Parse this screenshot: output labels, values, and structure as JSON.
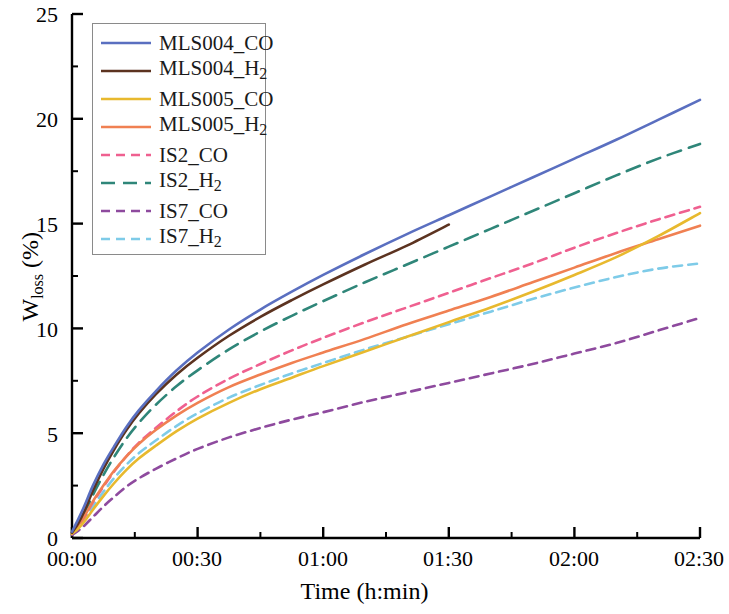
{
  "chart_data": {
    "type": "line",
    "title": "",
    "xlabel": "Time (h:min)",
    "ylabel": "W_loss (%)",
    "ylabel_base": "W",
    "ylabel_sub": "loss",
    "ylabel_unit": " (%)",
    "xlim": [
      0,
      150
    ],
    "ylim": [
      0,
      25
    ],
    "grid": false,
    "legend_position": "upper left",
    "x_tick_labels": [
      "00:00",
      "00:30",
      "01:00",
      "01:30",
      "02:00",
      "02:30"
    ],
    "x_tick_values": [
      0,
      30,
      60,
      90,
      120,
      150
    ],
    "y_tick_labels": [
      "0",
      "5",
      "10",
      "15",
      "20",
      "25"
    ],
    "y_tick_values": [
      0,
      5,
      10,
      15,
      20,
      25
    ],
    "x_minor_interval": 15,
    "y_minor_interval": 2.5,
    "series": [
      {
        "name": "MLS004_CO",
        "label_base": "MLS004_CO",
        "color": "#5a6fc0",
        "style": "solid",
        "x": [
          0,
          1.5,
          3,
          5,
          7.5,
          10,
          13,
          16,
          20,
          25,
          30,
          37.5,
          45,
          52.5,
          60,
          70,
          80,
          90,
          100,
          110,
          120,
          130,
          140,
          150
        ],
        "y": [
          0.3,
          0.9,
          1.55,
          2.5,
          3.5,
          4.35,
          5.3,
          6.1,
          7.0,
          8.0,
          8.85,
          9.95,
          10.9,
          11.75,
          12.55,
          13.55,
          14.5,
          15.4,
          16.3,
          17.2,
          18.1,
          19.0,
          19.95,
          20.9
        ]
      },
      {
        "name": "MLS004_H2",
        "label_base": "MLS004_",
        "label_sub": "2",
        "label_mid": "H",
        "color": "#5c3320",
        "style": "solid",
        "x": [
          0,
          1.5,
          3,
          5,
          7.5,
          10,
          13,
          16,
          20,
          25,
          30,
          37.5,
          45,
          52.5,
          60,
          70,
          80,
          90
        ],
        "y": [
          0.25,
          0.7,
          1.3,
          2.25,
          3.3,
          4.2,
          5.15,
          5.95,
          6.85,
          7.8,
          8.6,
          9.65,
          10.55,
          11.35,
          12.1,
          13.05,
          13.95,
          14.95
        ]
      },
      {
        "name": "MLS005_CO",
        "label_base": "MLS005_CO",
        "color": "#e8b92e",
        "style": "solid",
        "x": [
          0,
          1.5,
          3,
          5,
          7.5,
          10,
          13,
          16,
          20,
          25,
          30,
          37.5,
          45,
          52.5,
          60,
          70,
          80,
          90,
          100,
          110,
          120,
          130,
          140,
          150
        ],
        "y": [
          0.2,
          0.45,
          0.8,
          1.35,
          2.0,
          2.6,
          3.25,
          3.8,
          4.4,
          5.1,
          5.7,
          6.45,
          7.1,
          7.65,
          8.2,
          8.9,
          9.6,
          10.3,
          11.0,
          11.75,
          12.55,
          13.4,
          14.4,
          15.5
        ]
      },
      {
        "name": "MLS005_H2",
        "label_base": "MLS005_",
        "label_sub": "2",
        "label_mid": "H",
        "color": "#f08052",
        "style": "solid",
        "x": [
          0,
          1.5,
          3,
          5,
          7.5,
          10,
          13,
          16,
          20,
          25,
          30,
          37.5,
          45,
          52.5,
          60,
          70,
          80,
          90,
          100,
          110,
          120,
          130,
          140,
          150
        ],
        "y": [
          0.25,
          0.6,
          1.05,
          1.75,
          2.5,
          3.2,
          3.9,
          4.5,
          5.15,
          5.85,
          6.45,
          7.2,
          7.8,
          8.35,
          8.85,
          9.5,
          10.2,
          10.85,
          11.5,
          12.2,
          12.9,
          13.6,
          14.25,
          14.9
        ]
      },
      {
        "name": "IS2_CO",
        "label_base": "IS2_CO",
        "color": "#ef6090",
        "style": "dashed",
        "dash": "9,6",
        "x": [
          0,
          1.5,
          3,
          5,
          7.5,
          10,
          13,
          16,
          20,
          25,
          30,
          37.5,
          45,
          52.5,
          60,
          70,
          80,
          90,
          100,
          110,
          120,
          130,
          140,
          150
        ],
        "y": [
          0.2,
          0.55,
          1.0,
          1.7,
          2.45,
          3.15,
          3.9,
          4.55,
          5.25,
          6.05,
          6.75,
          7.6,
          8.3,
          8.95,
          9.55,
          10.3,
          11.0,
          11.7,
          12.4,
          13.1,
          13.85,
          14.55,
          15.2,
          15.8
        ]
      },
      {
        "name": "IS2_H2",
        "label_base": "IS2_",
        "label_sub": "2",
        "label_mid": "H",
        "color": "#2f8679",
        "style": "dashed",
        "dash": "14,8",
        "x": [
          0,
          1.5,
          3,
          5,
          7.5,
          10,
          13,
          16,
          20,
          25,
          30,
          37.5,
          45,
          52.5,
          60,
          70,
          80,
          90,
          100,
          110,
          120,
          130,
          140,
          150
        ],
        "y": [
          0.25,
          0.65,
          1.2,
          2.05,
          3.0,
          3.85,
          4.75,
          5.5,
          6.35,
          7.25,
          8.0,
          9.0,
          9.85,
          10.6,
          11.3,
          12.2,
          13.05,
          13.9,
          14.75,
          15.6,
          16.45,
          17.3,
          18.1,
          18.8
        ]
      },
      {
        "name": "IS7_CO",
        "label_base": "IS7_CO",
        "color": "#8e4a9e",
        "style": "dashed",
        "dash": "9,6",
        "x": [
          0,
          1.5,
          3,
          5,
          7.5,
          10,
          13,
          16,
          20,
          25,
          30,
          37.5,
          45,
          52.5,
          60,
          70,
          80,
          90,
          100,
          110,
          120,
          130,
          140,
          150
        ],
        "y": [
          0.15,
          0.35,
          0.6,
          1.0,
          1.5,
          1.95,
          2.45,
          2.85,
          3.3,
          3.8,
          4.25,
          4.8,
          5.25,
          5.65,
          6.0,
          6.5,
          6.95,
          7.4,
          7.85,
          8.3,
          8.8,
          9.3,
          9.9,
          10.5
        ]
      },
      {
        "name": "IS7_H2",
        "label_base": "IS7_",
        "label_sub": "2",
        "label_mid": "H",
        "color": "#7ecbe8",
        "style": "dashed",
        "dash": "9,6",
        "x": [
          0,
          1.5,
          3,
          5,
          7.5,
          10,
          13,
          16,
          20,
          25,
          30,
          37.5,
          45,
          52.5,
          60,
          70,
          80,
          90,
          100,
          110,
          120,
          130,
          140,
          150
        ],
        "y": [
          0.2,
          0.5,
          0.9,
          1.5,
          2.2,
          2.85,
          3.5,
          4.05,
          4.65,
          5.35,
          5.95,
          6.7,
          7.3,
          7.85,
          8.35,
          9.0,
          9.6,
          10.2,
          10.8,
          11.4,
          11.95,
          12.45,
          12.85,
          13.1
        ]
      }
    ]
  },
  "axes": {
    "x_title": "Time (h:min)",
    "y_title_base": "W",
    "y_title_sub": "loss",
    "y_title_unit": " (%)"
  }
}
